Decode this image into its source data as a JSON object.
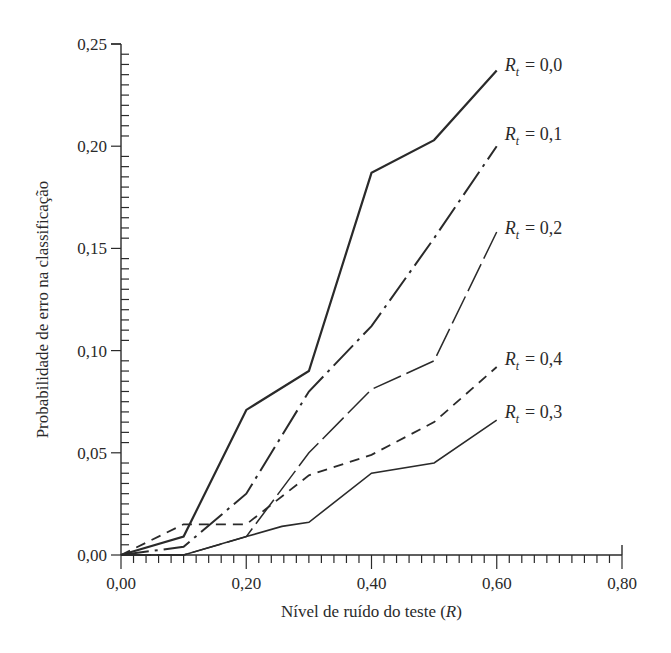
{
  "chart_data": {
    "type": "line",
    "title": "",
    "xlabel": "Nível de ruído do teste (R)",
    "xlabel_parts": {
      "text": "Nível de ruído do teste (",
      "var": "R",
      "close": ")"
    },
    "ylabel": "Probabilidade de erro na classificação",
    "xlim": [
      0,
      0.8
    ],
    "ylim": [
      0,
      0.25
    ],
    "x_ticks": [
      0,
      0.2,
      0.4,
      0.6,
      0.8
    ],
    "x_tick_labels": [
      "0,00",
      "0,20",
      "0,40",
      "0,60",
      "0,80"
    ],
    "x_minor_step": 0.02,
    "y_ticks": [
      0,
      0.05,
      0.1,
      0.15,
      0.2,
      0.25
    ],
    "y_tick_labels": [
      "0,00",
      "0,05",
      "0,10",
      "0,15",
      "0,20",
      "0,25"
    ],
    "y_minor_step": 0.005,
    "grid": false,
    "legend_position": "inline-right",
    "series": [
      {
        "name": "R_t = 0,0",
        "label_var": "R",
        "label_sub": "t",
        "label_value": "= 0,0",
        "style": "solid",
        "width": 2.2,
        "x": [
          0,
          0.1,
          0.2,
          0.3,
          0.4,
          0.5,
          0.6
        ],
        "y": [
          0,
          0.009,
          0.071,
          0.09,
          0.187,
          0.203,
          0.237
        ],
        "label_y": 0.238
      },
      {
        "name": "R_t = 0,1",
        "label_var": "R",
        "label_sub": "t",
        "label_value": "= 0,1",
        "style": "dashdot",
        "width": 2.0,
        "x": [
          0,
          0.1,
          0.2,
          0.3,
          0.4,
          0.5,
          0.6
        ],
        "y": [
          0,
          0.004,
          0.03,
          0.08,
          0.112,
          0.155,
          0.2
        ],
        "label_y": 0.204
      },
      {
        "name": "R_t = 0,2",
        "label_var": "R",
        "label_sub": "t",
        "label_value": "= 0,2",
        "style": "longdash",
        "width": 1.5,
        "x": [
          0,
          0.1,
          0.2,
          0.3,
          0.4,
          0.5,
          0.6
        ],
        "y": [
          0,
          0.0,
          0.009,
          0.05,
          0.081,
          0.095,
          0.158
        ],
        "label_y": 0.158
      },
      {
        "name": "R_t = 0,4",
        "label_var": "R",
        "label_sub": "t",
        "label_value": "= 0,4",
        "style": "dashed",
        "width": 1.8,
        "x": [
          0,
          0.1,
          0.2,
          0.3,
          0.4,
          0.5,
          0.6
        ],
        "y": [
          0,
          0.015,
          0.015,
          0.039,
          0.049,
          0.065,
          0.092
        ],
        "label_y": 0.094
      },
      {
        "name": "R_t = 0,3",
        "label_var": "R",
        "label_sub": "t",
        "label_value": "= 0,3",
        "style": "solid",
        "width": 1.6,
        "x": [
          0,
          0.1,
          0.2,
          0.257,
          0.3,
          0.4,
          0.5,
          0.6
        ],
        "y": [
          0,
          0.0,
          0.009,
          0.014,
          0.016,
          0.04,
          0.045,
          0.066
        ],
        "label_y": 0.068
      }
    ]
  },
  "layout": {
    "plot": {
      "x0": 121,
      "x1": 622,
      "y0": 555,
      "y1": 44
    },
    "colors": {
      "ink": "#2a2a2a",
      "background": "#ffffff"
    }
  }
}
